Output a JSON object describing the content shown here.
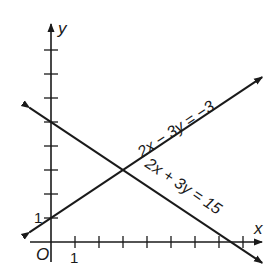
{
  "chart_data": {
    "type": "line",
    "title": "",
    "xlabel": "x",
    "ylabel": "y",
    "origin_label": "O",
    "x_tick_label": "1",
    "y_tick_label": "1",
    "x_ticks": [
      1,
      2,
      3,
      4,
      5,
      6,
      7,
      8
    ],
    "y_ticks": [
      1,
      2,
      3,
      4,
      5,
      6,
      7,
      8
    ],
    "xlim": [
      -1,
      9
    ],
    "ylim": [
      -1,
      9
    ],
    "grid": false,
    "series": [
      {
        "name": "2x − 3y = −3",
        "label": "2x − 3y = −3",
        "equation": "y = (2x + 3) / 3",
        "x": [
          -0.9,
          8.8
        ],
        "y": [
          0.4,
          6.87
        ]
      },
      {
        "name": "2x + 3y = 15",
        "label": "2x + 3y = 15",
        "equation": "y = (15 − 2x) / 3",
        "x": [
          -0.9,
          8.8
        ],
        "y": [
          5.6,
          -0.87
        ]
      }
    ],
    "intersection": {
      "x": 3,
      "y": 3
    },
    "line_color": "#1a1a1a"
  },
  "labels": {
    "x_axis": "x",
    "y_axis": "y",
    "origin": "O",
    "x_one": "1",
    "y_one": "1",
    "line1": "2x − 3y = −3",
    "line2": "2x + 3y = 15"
  }
}
